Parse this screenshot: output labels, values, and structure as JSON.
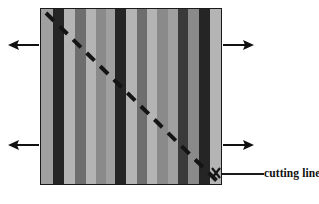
{
  "figure": {
    "background_color": "#ffffff",
    "width": 319,
    "height": 204
  },
  "specimen": {
    "name": "striped-block",
    "border_color": "#1a1a1a",
    "x": 40,
    "y": 8,
    "width": 182,
    "height": 177,
    "palette": {
      "light": "#b4b4b4",
      "light_mid": "#a0a0a0",
      "mid": "#8a8a8a",
      "mid_dark": "#6e6e6e",
      "dark": "#3a3a3a",
      "darkest": "#252525"
    },
    "stripes": [
      {
        "index": 1,
        "color": "#a0a0a0",
        "width": 13
      },
      {
        "index": 2,
        "color": "#252525",
        "width": 12
      },
      {
        "index": 3,
        "color": "#b4b4b4",
        "width": 11
      },
      {
        "index": 4,
        "color": "#6e6e6e",
        "width": 12
      },
      {
        "index": 5,
        "color": "#b4b4b4",
        "width": 11
      },
      {
        "index": 6,
        "color": "#8a8a8a",
        "width": 10
      },
      {
        "index": 7,
        "color": "#a0a0a0",
        "width": 10
      },
      {
        "index": 8,
        "color": "#252525",
        "width": 12
      },
      {
        "index": 9,
        "color": "#b4b4b4",
        "width": 11
      },
      {
        "index": 10,
        "color": "#6e6e6e",
        "width": 11
      },
      {
        "index": 11,
        "color": "#b4b4b4",
        "width": 11
      },
      {
        "index": 12,
        "color": "#8a8a8a",
        "width": 11
      },
      {
        "index": 13,
        "color": "#a0a0a0",
        "width": 11
      },
      {
        "index": 14,
        "color": "#3a3a3a",
        "width": 11
      },
      {
        "index": 15,
        "color": "#8a8a8a",
        "width": 11
      },
      {
        "index": 16,
        "color": "#252525",
        "width": 12
      },
      {
        "index": 17,
        "color": "#b4b4b4",
        "width": 12
      }
    ]
  },
  "cutting_line": {
    "name": "cutting-line",
    "style": "dashed",
    "color": "#141414",
    "stroke_width": 4,
    "dash_pattern": "11 8",
    "start": {
      "x": 46,
      "y": 13
    },
    "end": {
      "x": 218,
      "y": 182
    }
  },
  "callout": {
    "label": "cutting line",
    "leader_color": "#1a1a1a",
    "marker": "x"
  },
  "arrows": [
    {
      "name": "arrow-top-left",
      "direction": "left",
      "label": ""
    },
    {
      "name": "arrow-top-right",
      "direction": "right",
      "label": ""
    },
    {
      "name": "arrow-bottom-left",
      "direction": "left",
      "label": ""
    },
    {
      "name": "arrow-bottom-right",
      "direction": "right",
      "label": ""
    }
  ]
}
